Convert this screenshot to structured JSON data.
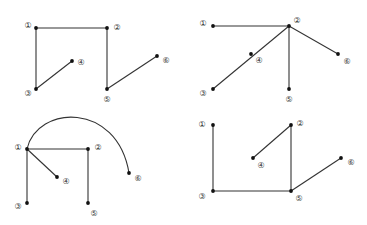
{
  "diagram": {
    "type": "graph-panels",
    "panels": [
      {
        "id": "top-left",
        "nodes": [
          {
            "label": "①",
            "x": 36,
            "y": 28,
            "lx": 28,
            "ly": 25
          },
          {
            "label": "②",
            "x": 107,
            "y": 28,
            "lx": 117,
            "ly": 27
          },
          {
            "label": "③",
            "x": 36,
            "y": 89,
            "lx": 28,
            "ly": 93
          },
          {
            "label": "④",
            "x": 72,
            "y": 61,
            "lx": 81,
            "ly": 62
          },
          {
            "label": "⑤",
            "x": 107,
            "y": 89,
            "lx": 107,
            "ly": 99
          },
          {
            "label": "⑥",
            "x": 157,
            "y": 56,
            "lx": 166,
            "ly": 60
          }
        ],
        "edges": [
          [
            "①",
            "②"
          ],
          [
            "①",
            "③"
          ],
          [
            "③",
            "④"
          ],
          [
            "②",
            "⑤"
          ],
          [
            "⑤",
            "⑥"
          ]
        ]
      },
      {
        "id": "top-right",
        "nodes": [
          {
            "label": "①",
            "x": 213,
            "y": 26,
            "lx": 203,
            "ly": 23
          },
          {
            "label": "②",
            "x": 289,
            "y": 26,
            "lx": 297,
            "ly": 20
          },
          {
            "label": "③",
            "x": 213,
            "y": 89,
            "lx": 203,
            "ly": 93
          },
          {
            "label": "④",
            "x": 251,
            "y": 54,
            "lx": 259,
            "ly": 60
          },
          {
            "label": "⑤",
            "x": 289,
            "y": 89,
            "lx": 289,
            "ly": 99
          },
          {
            "label": "⑥",
            "x": 338,
            "y": 54,
            "lx": 347,
            "ly": 61
          }
        ],
        "edges": [
          [
            "①",
            "②"
          ],
          [
            "②",
            "③"
          ],
          [
            "②",
            "⑤"
          ],
          [
            "②",
            "⑥"
          ]
        ],
        "notes": "④ lies on edge ②–③"
      },
      {
        "id": "bottom-left",
        "nodes": [
          {
            "label": "①",
            "x": 27,
            "y": 149,
            "lx": 18,
            "ly": 147
          },
          {
            "label": "②",
            "x": 88,
            "y": 149,
            "lx": 98,
            "ly": 147
          },
          {
            "label": "③",
            "x": 27,
            "y": 203,
            "lx": 18,
            "ly": 206
          },
          {
            "label": "④",
            "x": 57,
            "y": 177,
            "lx": 66,
            "ly": 181
          },
          {
            "label": "⑤",
            "x": 88,
            "y": 203,
            "lx": 94,
            "ly": 213
          },
          {
            "label": "⑥",
            "x": 129,
            "y": 173,
            "lx": 138,
            "ly": 178
          }
        ],
        "edges": [
          [
            "①",
            "②"
          ],
          [
            "①",
            "③"
          ],
          [
            "①",
            "④"
          ],
          [
            "②",
            "⑤"
          ]
        ],
        "curved_edges": [
          [
            "①",
            "⑥"
          ]
        ]
      },
      {
        "id": "bottom-right",
        "nodes": [
          {
            "label": "①",
            "x": 213,
            "y": 125,
            "lx": 202,
            "ly": 124
          },
          {
            "label": "②",
            "x": 291,
            "y": 125,
            "lx": 300,
            "ly": 123
          },
          {
            "label": "③",
            "x": 213,
            "y": 191,
            "lx": 202,
            "ly": 196
          },
          {
            "label": "④",
            "x": 253,
            "y": 158,
            "lx": 261,
            "ly": 165
          },
          {
            "label": "⑤",
            "x": 291,
            "y": 191,
            "lx": 299,
            "ly": 198
          },
          {
            "label": "⑥",
            "x": 341,
            "y": 158,
            "lx": 351,
            "ly": 162
          }
        ],
        "edges": [
          [
            "①",
            "③"
          ],
          [
            "③",
            "⑤"
          ],
          [
            "②",
            "④"
          ],
          [
            "②",
            "⑤"
          ],
          [
            "⑤",
            "⑥"
          ]
        ]
      }
    ]
  },
  "styles": {
    "edge_color": "#333333",
    "node_color": "#111111",
    "background": "#ffffff"
  }
}
